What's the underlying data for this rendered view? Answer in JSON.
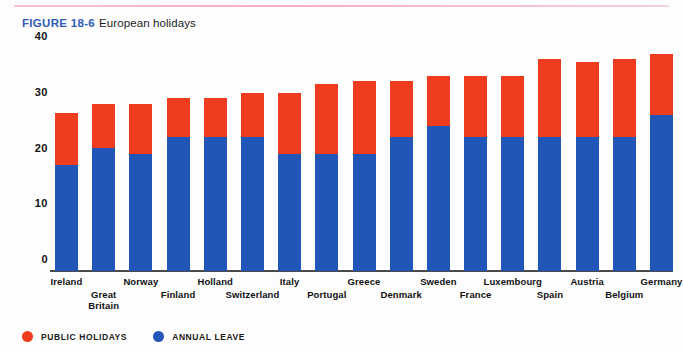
{
  "figure": {
    "number_label": "FIGURE 18-6",
    "title": "European holidays"
  },
  "legend": {
    "items": [
      {
        "label": "PUBLIC HOLIDAYS",
        "color": "#f03c1e",
        "icon": "circle-icon"
      },
      {
        "label": "ANNUAL LEAVE",
        "color": "#2255b8",
        "icon": "circle-icon"
      }
    ]
  },
  "axis": {
    "y_ticks": [
      "0",
      "10",
      "20",
      "30",
      "40"
    ]
  },
  "chart_data": {
    "type": "bar",
    "stacked": true,
    "title": "European holidays",
    "xlabel": "",
    "ylabel": "",
    "ylim": [
      0,
      40
    ],
    "yticks": [
      0,
      10,
      20,
      30,
      40
    ],
    "grid": false,
    "legend_position": "bottom-left",
    "categories": [
      "Ireland",
      "Great Britain",
      "Norway",
      "Finland",
      "Holland",
      "Switzerland",
      "Italy",
      "Portugal",
      "Greece",
      "Denmark",
      "Sweden",
      "France",
      "Luxembourg",
      "Spain",
      "Austria",
      "Belgium",
      "Germany"
    ],
    "series": [
      {
        "name": "ANNUAL LEAVE",
        "color": "#2255b8",
        "values": [
          19,
          22,
          21,
          24,
          24,
          24,
          21,
          21,
          21,
          24,
          26,
          24,
          24,
          24,
          24,
          24,
          28
        ]
      },
      {
        "name": "PUBLIC HOLIDAYS",
        "color": "#f03c1e",
        "values": [
          9.3,
          8,
          9,
          7,
          7,
          8,
          11,
          12.5,
          13,
          10,
          9,
          11,
          11,
          14,
          13.5,
          14,
          11
        ]
      }
    ],
    "totals": [
      28.3,
      30,
      30,
      31,
      31,
      32,
      32,
      33.5,
      34,
      34,
      35,
      35,
      35,
      38,
      37.5,
      38,
      39
    ]
  }
}
